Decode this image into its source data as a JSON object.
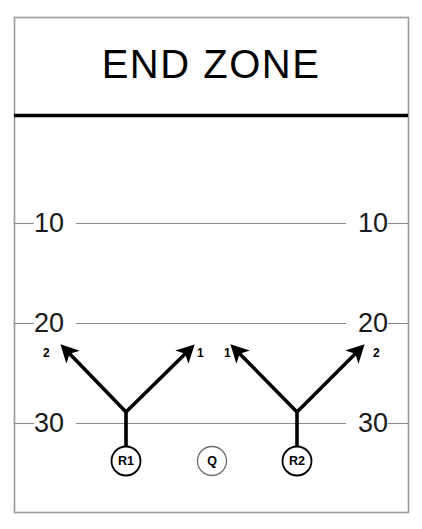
{
  "diagram": {
    "title": "END ZONE",
    "type": "football-play-diagram"
  },
  "field": {
    "goal_line_label": "goal-line",
    "yard_lines": [
      {
        "label_left": "10",
        "label_right": "10",
        "y": 223
      },
      {
        "label_left": "20",
        "label_right": "20",
        "y": 323
      },
      {
        "label_left": "30",
        "label_right": "30",
        "y": 423
      }
    ]
  },
  "players": [
    {
      "id": "R1",
      "label": "R1",
      "cx": 126,
      "cy": 461,
      "r": 14,
      "role": "receiver"
    },
    {
      "id": "Q",
      "label": "Q",
      "cx": 212,
      "cy": 461,
      "r": 14,
      "role": "quarterback"
    },
    {
      "id": "R2",
      "label": "R2",
      "cx": 297,
      "cy": 461,
      "r": 14,
      "role": "receiver"
    }
  ],
  "routes": [
    {
      "player": "R1",
      "branch": "outside",
      "label": "2",
      "label_x": 45,
      "label_y": 347
    },
    {
      "player": "R1",
      "branch": "inside",
      "label": "1",
      "label_x": 199,
      "label_y": 347
    },
    {
      "player": "R2",
      "branch": "inside",
      "label": "1",
      "label_x": 225,
      "label_y": 347
    },
    {
      "player": "R2",
      "branch": "outside",
      "label": "2",
      "label_x": 374,
      "label_y": 347
    }
  ],
  "colors": {
    "ink": "#000000",
    "yard_line": "#8c8c8c",
    "border": "#9a9a9a",
    "background": "#ffffff"
  }
}
